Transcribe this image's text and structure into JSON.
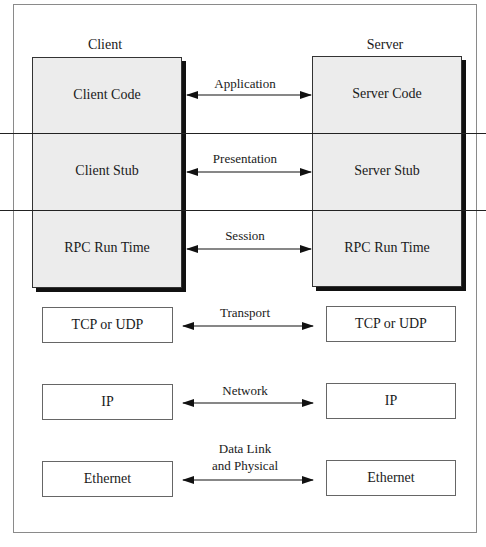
{
  "diagram": {
    "columns": {
      "client": "Client",
      "server": "Server"
    },
    "client_stack": [
      "Client Code",
      "Client Stub",
      "RPC Run Time"
    ],
    "server_stack": [
      "Server Code",
      "Server Stub",
      "RPC Run Time"
    ],
    "client_lower": [
      "TCP or UDP",
      "IP",
      "Ethernet"
    ],
    "server_lower": [
      "TCP or UDP",
      "IP",
      "Ethernet"
    ],
    "layers": [
      {
        "label": "Application"
      },
      {
        "label": "Presentation"
      },
      {
        "label": "Session"
      },
      {
        "label": "Transport"
      },
      {
        "label": "Network"
      },
      {
        "label_line1": "Data Link",
        "label_line2": "and Physical"
      }
    ],
    "colors": {
      "stack_fill": "#ececec",
      "shadow": "#111111",
      "line": "#222222",
      "frame": "#8a8a8a"
    }
  }
}
